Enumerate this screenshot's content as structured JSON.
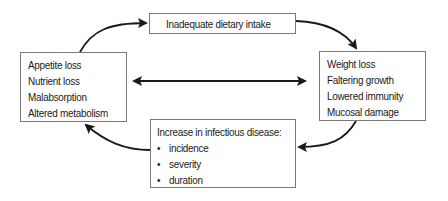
{
  "diagram": {
    "top_box": {
      "lines": [
        "Inadequate dietary intake"
      ]
    },
    "left_box": {
      "lines": [
        "Appetite loss",
        "Nutrient loss",
        "Malabsorption",
        "Altered metabolism"
      ]
    },
    "right_box": {
      "lines": [
        "Weight loss",
        "Faltering growth",
        "Lowered immunity",
        "Mucosal damage"
      ]
    },
    "bottom_box": {
      "title": "Increase in infectious disease:",
      "bullets": [
        "incidence",
        "severity",
        "duration"
      ],
      "bullet_glyph": "•"
    },
    "arrows": [
      {
        "from": "left_box",
        "to": "top_box",
        "style": "curved"
      },
      {
        "from": "top_box",
        "to": "right_box",
        "style": "curved"
      },
      {
        "from": "right_box",
        "to": "bottom_box",
        "style": "curved"
      },
      {
        "from": "bottom_box",
        "to": "left_box",
        "style": "curved"
      },
      {
        "from": "left_box",
        "to": "right_box",
        "style": "double-headed"
      }
    ],
    "colors": {
      "line": "#1a1a1a",
      "border": "#7a7a7a",
      "background": "#ffffff"
    }
  }
}
